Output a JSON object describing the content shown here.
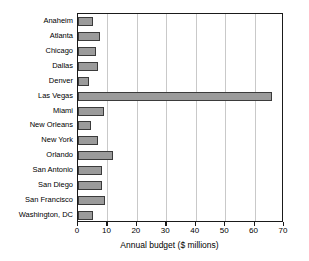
{
  "chart_data": {
    "type": "bar",
    "orientation": "horizontal",
    "title": "",
    "xlabel": "Annual budget ($ millions)",
    "ylabel": "",
    "xlim": [
      0,
      70
    ],
    "xticks": [
      0,
      10,
      20,
      30,
      40,
      50,
      60,
      70
    ],
    "xtick_labels": [
      "0",
      "10",
      "20",
      "30",
      "40",
      "50",
      "60",
      "70"
    ],
    "grid": "vertical",
    "legend": null,
    "categories": [
      "Anaheim",
      "Atlanta",
      "Chicago",
      "Dallas",
      "Denver",
      "Las Vegas",
      "Miami",
      "New Orleans",
      "New York",
      "Orlando",
      "San Antonio",
      "San Diego",
      "San Francisco",
      "Washington, DC"
    ],
    "values": [
      5,
      7.6,
      6,
      6.7,
      3.8,
      66,
      8.8,
      4.4,
      6.8,
      12,
      8,
      8,
      9.2,
      5
    ],
    "colors": {
      "bar_fill": "#9b9b9b",
      "bar_edge": "#3b3b3b",
      "grid": "#c9c9c9",
      "frame": "#1a1a1a",
      "text": "#000000",
      "background": "#ffffff"
    }
  }
}
